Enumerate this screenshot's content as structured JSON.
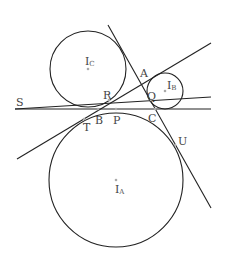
{
  "diagram": {
    "title": "",
    "colors": {
      "stroke": "#222222",
      "label": "#444444",
      "point": "#aaaaaa",
      "background": "#ffffff"
    },
    "circles": [
      {
        "id": "IC",
        "cx": 88,
        "cy": 69,
        "r": 38
      },
      {
        "id": "IB",
        "cx": 165,
        "cy": 91,
        "r": 18
      },
      {
        "id": "IA",
        "cx": 116,
        "cy": 180,
        "r": 67
      }
    ],
    "lines": [
      {
        "id": "line-SC",
        "x1": 15,
        "y1": 109,
        "x2": 211,
        "y2": 109
      },
      {
        "id": "line-SQ",
        "x1": 15,
        "y1": 109,
        "x2": 211,
        "y2": 97
      },
      {
        "id": "line-AC",
        "x1": 108,
        "y1": 25,
        "x2": 211,
        "y2": 208
      },
      {
        "id": "line-TA",
        "x1": 17,
        "y1": 159,
        "x2": 211,
        "y2": 43
      }
    ],
    "points": [
      {
        "id": "IC",
        "x": 88,
        "y": 69
      },
      {
        "id": "IB",
        "x": 165,
        "y": 91
      },
      {
        "id": "IA",
        "x": 116,
        "y": 180
      },
      {
        "id": "R",
        "x": 109,
        "y": 100
      },
      {
        "id": "B",
        "x": 98,
        "y": 109
      },
      {
        "id": "P",
        "x": 116,
        "y": 109
      },
      {
        "id": "Q",
        "x": 151,
        "y": 100
      },
      {
        "id": "C",
        "x": 155,
        "y": 109
      },
      {
        "id": "T",
        "x": 84,
        "y": 119
      },
      {
        "id": "U",
        "x": 175,
        "y": 145
      }
    ],
    "labels": [
      {
        "id": "S",
        "text": "S",
        "x": 16,
        "y": 106
      },
      {
        "id": "R",
        "text": "R",
        "x": 103,
        "y": 99
      },
      {
        "id": "B",
        "text": "B",
        "x": 95,
        "y": 124
      },
      {
        "id": "P",
        "text": "P",
        "x": 113,
        "y": 124
      },
      {
        "id": "T",
        "text": "T",
        "x": 83,
        "y": 131
      },
      {
        "id": "A",
        "text": "A",
        "x": 140,
        "y": 77
      },
      {
        "id": "Q",
        "text": "Q",
        "x": 147,
        "y": 100
      },
      {
        "id": "C",
        "text": "C",
        "x": 148,
        "y": 122
      },
      {
        "id": "U",
        "text": "U",
        "x": 178,
        "y": 145
      }
    ],
    "center_labels": [
      {
        "id": "IC",
        "main": "I",
        "sub": "C",
        "x": 85,
        "y": 65
      },
      {
        "id": "IB",
        "main": "I",
        "sub": "B",
        "x": 167,
        "y": 89
      },
      {
        "id": "IA",
        "main": "I",
        "sub": "A",
        "x": 115,
        "y": 193
      }
    ]
  }
}
